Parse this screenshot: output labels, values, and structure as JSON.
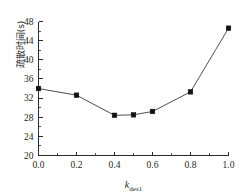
{
  "chart_data": {
    "type": "line",
    "title": "",
    "subtitle": "",
    "xlabel": "k_des1",
    "xlabel_base": "k",
    "xlabel_sub": "des1",
    "ylabel": "疏散时间(s)",
    "x": [
      0.0,
      0.2,
      0.4,
      0.5,
      0.6,
      0.8,
      1.0
    ],
    "values": [
      34.0,
      32.6,
      28.4,
      28.5,
      29.2,
      33.3,
      46.6
    ],
    "series": [
      {
        "name": "疏散时间",
        "x": [
          0.0,
          0.2,
          0.4,
          0.5,
          0.6,
          0.8,
          1.0
        ],
        "values": [
          34.0,
          32.6,
          28.4,
          28.5,
          29.2,
          33.3,
          46.6
        ]
      }
    ],
    "xlim": [
      0.0,
      1.0
    ],
    "ylim": [
      20,
      48
    ],
    "xticks": [
      0.0,
      0.2,
      0.4,
      0.6,
      0.8,
      1.0
    ],
    "xticklabels": [
      "0.0",
      "0.2",
      "0.4",
      "0.6",
      "0.8",
      "1.0"
    ],
    "yticks": [
      20,
      24,
      28,
      32,
      36,
      40,
      44,
      48
    ],
    "yticklabels": [
      "20",
      "24",
      "28",
      "32",
      "36",
      "40",
      "44",
      "48"
    ],
    "x_minor_ticks": [
      0.1,
      0.3,
      0.5,
      0.7,
      0.9
    ],
    "y_minor_ticks": [
      22,
      26,
      30,
      34,
      38,
      42,
      46
    ],
    "grid": false,
    "legend": null,
    "legend_position": "none",
    "marker": "square",
    "marker_color": "#111111",
    "line_color": "#3a3a3a",
    "background_color": "#ffffff",
    "axis_color": "#2b2b2b"
  }
}
